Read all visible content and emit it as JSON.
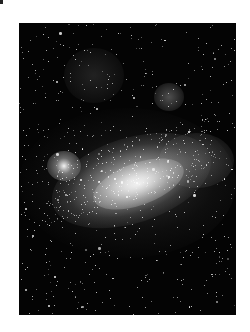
{
  "image": {
    "subject": "spiral galaxy star field",
    "alt": "Black-and-white astronomical photograph of a galaxy with a bright central bar surrounded by dense star fields",
    "colors": {
      "page_background": "#ffffff",
      "sky": "#040404",
      "core": "#ebebeb"
    }
  }
}
